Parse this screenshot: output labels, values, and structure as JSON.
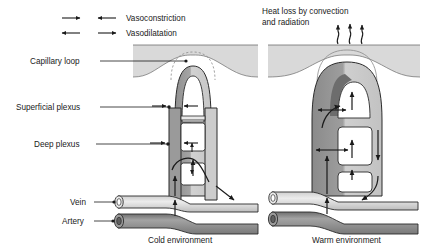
{
  "figure": {
    "title_present": false,
    "legend": {
      "items": [
        {
          "id": "vasoconstriction",
          "label": "Vasoconstriction",
          "arrows": "inward",
          "icon": "arrows-converging-icon"
        },
        {
          "id": "vasodilatation",
          "label": "Vasodilatation",
          "arrows": "outward",
          "icon": "arrows-diverging-icon"
        }
      ]
    },
    "annotations": {
      "heat_loss": {
        "label_line1": "Heat loss by convection",
        "label_line2": "and radiation",
        "icon": "wavy-up-arrows-icon",
        "arrow_count": 3
      }
    },
    "labels": [
      {
        "id": "capillary-loop",
        "text": "Capillary loop"
      },
      {
        "id": "superficial-plexus",
        "text": "Superficial plexus"
      },
      {
        "id": "deep-plexus",
        "text": "Deep plexus"
      },
      {
        "id": "vein",
        "text": "Vein"
      },
      {
        "id": "artery",
        "text": "Artery"
      }
    ],
    "panels": [
      {
        "id": "cold",
        "caption": "Cold environment",
        "state": "vasoconstriction"
      },
      {
        "id": "warm",
        "caption": "Warm environment",
        "state": "vasodilatation"
      }
    ],
    "colors": {
      "skin_band": "#d9d9d9",
      "vessel_dark": "#8c8c8c",
      "vessel_mid": "#a8a8a8",
      "vessel_light": "#c9c9c9",
      "vessel_pale": "#e3e3e3",
      "outline": "#2b2b2b",
      "arrow": "#1a1a1a",
      "text": "#1a1a1a",
      "background": "#ffffff"
    }
  }
}
